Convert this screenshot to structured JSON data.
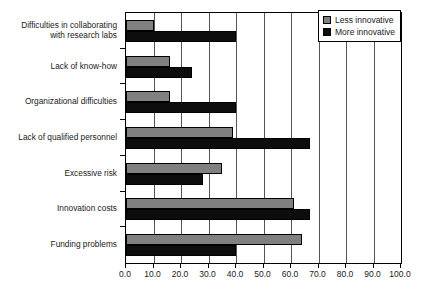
{
  "chart_data": {
    "type": "bar",
    "orientation": "horizontal",
    "title": "",
    "xlabel": "",
    "ylabel": "",
    "xlim": [
      0.0,
      100.0
    ],
    "xticks": [
      "0.0",
      "10.0",
      "20.0",
      "30.0",
      "40.0",
      "50.0",
      "60.0",
      "70.0",
      "80.0",
      "90.0",
      "100.0"
    ],
    "xtick_values": [
      0,
      10,
      20,
      30,
      40,
      50,
      60,
      70,
      80,
      90,
      100
    ],
    "grid": "vertical",
    "legend_position": "top-right",
    "categories": [
      "Difficulties in collaborating\nwith research labs",
      "Lack of know-how",
      "Organizational difficulties",
      "Lack of qualified personnel",
      "Excessive risk",
      "Innovation costs",
      "Funding problems"
    ],
    "series": [
      {
        "name": "Less innovative",
        "color": "#808080",
        "values": [
          10,
          16,
          16,
          39,
          35,
          61,
          64
        ]
      },
      {
        "name": "More innovative",
        "color": "#0d0d0d",
        "values": [
          40,
          24,
          40,
          67,
          28,
          67,
          40
        ]
      }
    ]
  },
  "legend": {
    "items": [
      {
        "label": "Less innovative",
        "swatch": "less"
      },
      {
        "label": "More innovative",
        "swatch": "more"
      }
    ]
  }
}
